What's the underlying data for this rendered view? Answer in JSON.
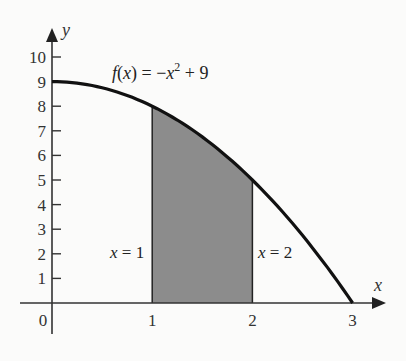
{
  "chart_data": {
    "type": "area",
    "title": "",
    "function_label": {
      "f": "f",
      "x": "x",
      "eq": " = −",
      "xsq": "x",
      "exp": "2",
      "tail": " + 9"
    },
    "xlabel": "x",
    "ylabel": "y",
    "xlim": [
      0,
      3
    ],
    "ylim": [
      0,
      10
    ],
    "x_ticks": [
      "0",
      "1",
      "2",
      "3"
    ],
    "y_ticks": [
      "1",
      "2",
      "3",
      "4",
      "5",
      "6",
      "7",
      "8",
      "9",
      "10"
    ],
    "grid": false,
    "series": [
      {
        "name": "f(x) = -x^2 + 9",
        "x": [
          0,
          0.5,
          1,
          1.5,
          2,
          2.5,
          3
        ],
        "y": [
          9,
          8.75,
          8,
          6.75,
          5,
          2.75,
          0
        ]
      }
    ],
    "shaded_region": {
      "x_from": 1,
      "x_to": 2,
      "color": "#8c8c8c"
    },
    "annotations": [
      {
        "text_var": "x",
        "text_rest": " = 1",
        "at_x": 1
      },
      {
        "text_var": "x",
        "text_rest": " = 2",
        "at_x": 2
      }
    ]
  }
}
